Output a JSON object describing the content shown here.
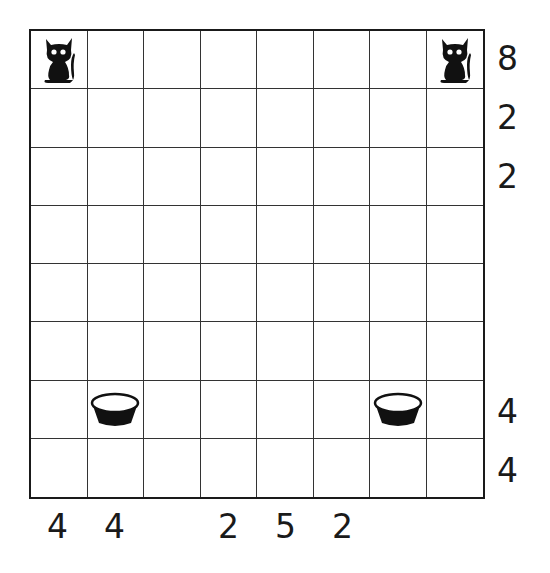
{
  "puzzle": {
    "rows": 8,
    "cols": 8,
    "cells": [
      {
        "row": 0,
        "col": 0,
        "icon": "cat-icon"
      },
      {
        "row": 0,
        "col": 7,
        "icon": "cat-icon"
      },
      {
        "row": 6,
        "col": 1,
        "icon": "bowl-icon"
      },
      {
        "row": 6,
        "col": 6,
        "icon": "bowl-icon"
      }
    ],
    "row_clues": [
      "8",
      "2",
      "2",
      "",
      "",
      "",
      "4",
      "4"
    ],
    "col_clues": [
      "4",
      "4",
      "",
      "2",
      "5",
      "2",
      "",
      ""
    ]
  },
  "colors": {
    "ink": "#1a1a1a",
    "grid_line": "#333333",
    "background": "#ffffff"
  }
}
